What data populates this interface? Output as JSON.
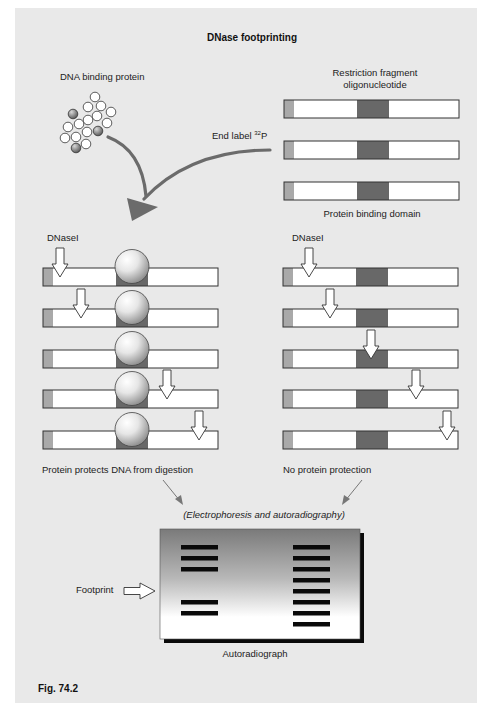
{
  "title": "DNase footprinting",
  "figure_label": "Fig. 74.2",
  "labels": {
    "dna_binding_protein": "DNA binding protein",
    "restriction_fragment_line1": "Restriction fragment",
    "restriction_fragment_line2": "oligonucleotide",
    "end_label": "End label ",
    "isotope_mass": "32",
    "isotope_symbol": "P",
    "protein_binding_domain": "Protein binding domain",
    "dnase_left": "DNaseI",
    "dnase_right": "DNaseI",
    "protected": "Protein protects DNA from digestion",
    "unprotected": "No protein protection",
    "method": "(Electrophoresis and autoradiography)",
    "footprint": "Footprint",
    "autoradiograph": "Autoradiograph"
  },
  "colors": {
    "panel": "#e9e9e9",
    "bar_outline": "#333333",
    "end_label": "#a9a9a9",
    "binding_domain": "#686868",
    "curve_arrow": "#6b6b6b",
    "band": "#0a0a0a"
  },
  "diagram": {
    "protein_cluster": [
      {
        "x": 95,
        "y": 97,
        "dark": false
      },
      {
        "x": 88,
        "y": 107,
        "dark": false
      },
      {
        "x": 101,
        "y": 106,
        "dark": false
      },
      {
        "x": 111,
        "y": 112,
        "dark": false
      },
      {
        "x": 73,
        "y": 114,
        "dark": true
      },
      {
        "x": 97,
        "y": 116,
        "dark": false
      },
      {
        "x": 88,
        "y": 120,
        "dark": false
      },
      {
        "x": 79,
        "y": 124,
        "dark": false
      },
      {
        "x": 107,
        "y": 123,
        "dark": false
      },
      {
        "x": 68,
        "y": 127,
        "dark": false
      },
      {
        "x": 87,
        "y": 132,
        "dark": false
      },
      {
        "x": 98,
        "y": 131,
        "dark": true
      },
      {
        "x": 76,
        "y": 137,
        "dark": false
      },
      {
        "x": 65,
        "y": 138,
        "dark": false
      },
      {
        "x": 86,
        "y": 144,
        "dark": false
      },
      {
        "x": 76,
        "y": 148,
        "dark": true
      }
    ],
    "fragments": [
      {
        "x": 284,
        "y": 100
      },
      {
        "x": 284,
        "y": 141
      },
      {
        "x": 284,
        "y": 182
      }
    ],
    "protected_lanes": [
      {
        "y": 268,
        "cut_x": 60
      },
      {
        "y": 309,
        "cut_x": 81
      },
      {
        "y": 350,
        "cut_x": null
      },
      {
        "y": 390,
        "cut_x": 167
      },
      {
        "y": 431,
        "cut_x": 199
      }
    ],
    "unprotected_lanes": [
      {
        "y": 268,
        "cut_x": 309
      },
      {
        "y": 309,
        "cut_x": 330
      },
      {
        "y": 350,
        "cut_x": 371
      },
      {
        "y": 390,
        "cut_x": 416
      },
      {
        "y": 431,
        "cut_x": 447
      }
    ]
  },
  "autoradiograph": {
    "lanes": [
      {
        "name": "protected",
        "band_rows": [
          0,
          1,
          2,
          5,
          6
        ]
      },
      {
        "name": "unprotected",
        "band_rows": [
          0,
          1,
          2,
          3,
          4,
          5,
          6,
          7
        ]
      }
    ],
    "footprint_rows": [
      3,
      4
    ]
  }
}
